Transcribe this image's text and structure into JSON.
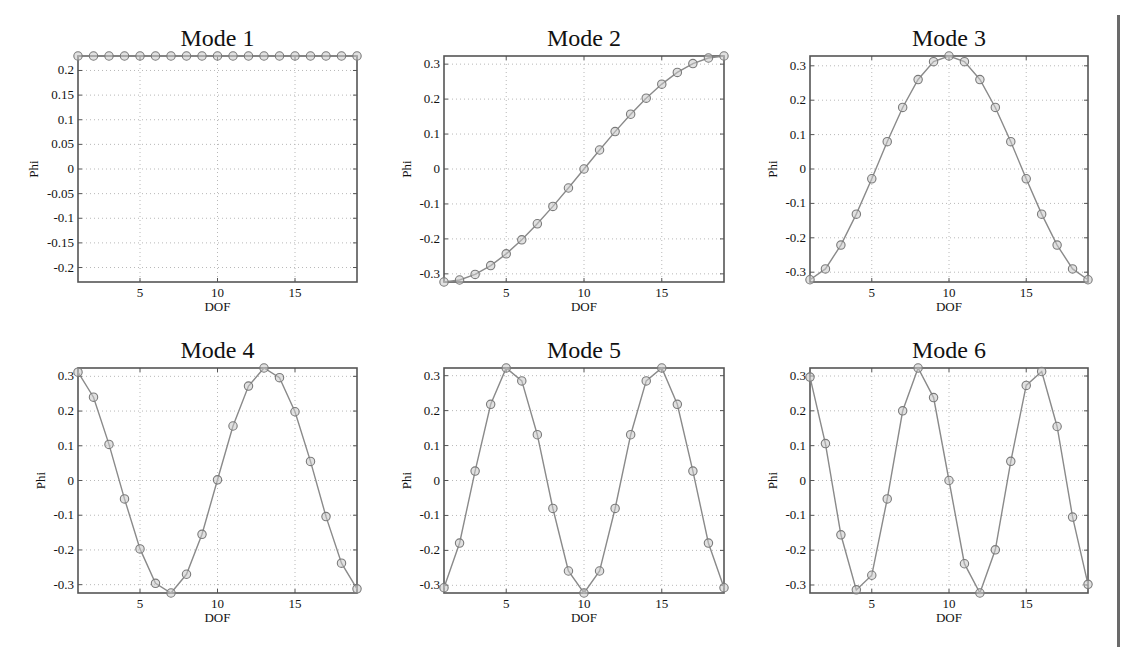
{
  "figure": {
    "layout": {
      "rows": 2,
      "cols": 3
    },
    "colors": {
      "line": "#8a8a8a",
      "marker_edge": "#7a7a7a",
      "marker_fill": "#c8c8c8",
      "axes": "#555555",
      "grid": "#b8b8b8"
    }
  },
  "chart_data": [
    {
      "type": "line",
      "title": "Mode 1",
      "xlabel": "DOF",
      "ylabel": "Phi",
      "x": [
        1,
        2,
        3,
        4,
        5,
        6,
        7,
        8,
        9,
        10,
        11,
        12,
        13,
        14,
        15,
        16,
        17,
        18,
        19
      ],
      "values": [
        0.2294,
        0.2294,
        0.2294,
        0.2294,
        0.2294,
        0.2294,
        0.2294,
        0.2294,
        0.2294,
        0.2294,
        0.2294,
        0.2294,
        0.2294,
        0.2294,
        0.2294,
        0.2294,
        0.2294,
        0.2294,
        0.2294
      ],
      "xlim": [
        1,
        19
      ],
      "ylim": [
        -0.2294,
        0.2294
      ],
      "xticks": [
        5,
        10,
        15
      ],
      "yticks": [
        0.2,
        0.15,
        0.1,
        0.05,
        0,
        -0.05,
        -0.1,
        -0.15,
        -0.2
      ],
      "ytick_labels": [
        "0.2",
        "0.15",
        "0.1",
        "0.05",
        "0",
        "-0.05",
        "-0.1",
        "-0.15",
        "-0.2"
      ],
      "grid": true,
      "marker": "circle"
    },
    {
      "type": "line",
      "title": "Mode 2",
      "xlabel": "DOF",
      "ylabel": "Phi",
      "x": [
        1,
        2,
        3,
        4,
        5,
        6,
        7,
        8,
        9,
        10,
        11,
        12,
        13,
        14,
        15,
        16,
        17,
        18,
        19
      ],
      "values": [
        -0.3233,
        -0.3176,
        -0.3016,
        -0.2763,
        -0.2428,
        -0.2025,
        -0.1567,
        -0.1071,
        -0.0544,
        0.0,
        0.0544,
        0.1071,
        0.1567,
        0.2025,
        0.2428,
        0.2763,
        0.3016,
        0.3176,
        0.3233
      ],
      "xlim": [
        1,
        19
      ],
      "ylim": [
        -0.3233,
        0.3233
      ],
      "xticks": [
        5,
        10,
        15
      ],
      "yticks": [
        0.3,
        0.2,
        0.1,
        0,
        -0.1,
        -0.2,
        -0.3
      ],
      "ytick_labels": [
        "0.3",
        "0.2",
        "0.1",
        "0",
        "-0.1",
        "-0.2",
        "-0.3"
      ],
      "grid": true,
      "marker": "circle"
    },
    {
      "type": "line",
      "title": "Mode 3",
      "xlabel": "DOF",
      "ylabel": "Phi",
      "x": [
        1,
        2,
        3,
        4,
        5,
        6,
        7,
        8,
        9,
        10,
        11,
        12,
        13,
        14,
        15,
        16,
        17,
        18,
        19
      ],
      "values": [
        -0.322,
        -0.2904,
        -0.2213,
        -0.1312,
        -0.0284,
        0.0795,
        0.1789,
        0.2601,
        0.3121,
        0.3285,
        0.3121,
        0.2601,
        0.1789,
        0.0795,
        -0.0284,
        -0.1312,
        -0.2213,
        -0.2904,
        -0.322
      ],
      "xlim": [
        1,
        19
      ],
      "ylim": [
        -0.3285,
        0.3285
      ],
      "xticks": [
        5,
        10,
        15
      ],
      "yticks": [
        0.3,
        0.2,
        0.1,
        0,
        -0.1,
        -0.2,
        -0.3
      ],
      "ytick_labels": [
        "0.3",
        "0.2",
        "0.1",
        "0",
        "-0.1",
        "-0.2",
        "-0.3"
      ],
      "grid": true,
      "marker": "circle"
    },
    {
      "type": "line",
      "title": "Mode 4",
      "xlabel": "DOF",
      "ylabel": "Phi",
      "x": [
        1,
        2,
        3,
        4,
        5,
        6,
        7,
        8,
        9,
        10,
        11,
        12,
        13,
        14,
        15,
        16,
        17,
        18,
        19
      ],
      "values": [
        0.312,
        0.24,
        0.104,
        -0.053,
        -0.197,
        -0.296,
        -0.324,
        -0.27,
        -0.155,
        0.002,
        0.157,
        0.272,
        0.324,
        0.296,
        0.198,
        0.055,
        -0.104,
        -0.238,
        -0.312
      ],
      "xlim": [
        1,
        19
      ],
      "ylim": [
        -0.324,
        0.324
      ],
      "xticks": [
        5,
        10,
        15
      ],
      "yticks": [
        0.3,
        0.2,
        0.1,
        0,
        -0.1,
        -0.2,
        -0.3
      ],
      "ytick_labels": [
        "0.3",
        "0.2",
        "0.1",
        "0",
        "-0.1",
        "-0.2",
        "-0.3"
      ],
      "grid": true,
      "marker": "circle"
    },
    {
      "type": "line",
      "title": "Mode 5",
      "xlabel": "DOF",
      "ylabel": "Phi",
      "x": [
        1,
        2,
        3,
        4,
        5,
        6,
        7,
        8,
        9,
        10,
        11,
        12,
        13,
        14,
        15,
        16,
        17,
        18,
        19
      ],
      "values": [
        -0.307,
        -0.179,
        0.027,
        0.218,
        0.322,
        0.285,
        0.131,
        -0.08,
        -0.259,
        -0.322,
        -0.259,
        -0.08,
        0.131,
        0.285,
        0.322,
        0.218,
        0.027,
        -0.179,
        -0.307
      ],
      "xlim": [
        1,
        19
      ],
      "ylim": [
        -0.322,
        0.322
      ],
      "xticks": [
        5,
        10,
        15
      ],
      "yticks": [
        0.3,
        0.2,
        0.1,
        0,
        -0.1,
        -0.2,
        -0.3
      ],
      "ytick_labels": [
        "0.3",
        "0.2",
        "0.1",
        "0",
        "-0.1",
        "-0.2",
        "-0.3"
      ],
      "grid": true,
      "marker": "circle"
    },
    {
      "type": "line",
      "title": "Mode 6",
      "xlabel": "DOF",
      "ylabel": "Phi",
      "x": [
        1,
        2,
        3,
        4,
        5,
        6,
        7,
        8,
        9,
        10,
        11,
        12,
        13,
        14,
        15,
        16,
        17,
        18,
        19
      ],
      "values": [
        0.297,
        0.106,
        -0.156,
        -0.314,
        -0.272,
        -0.053,
        0.2,
        0.323,
        0.238,
        0.0,
        -0.239,
        -0.323,
        -0.199,
        0.055,
        0.273,
        0.313,
        0.155,
        -0.105,
        -0.298
      ],
      "xlim": [
        1,
        19
      ],
      "ylim": [
        -0.323,
        0.323
      ],
      "xticks": [
        5,
        10,
        15
      ],
      "yticks": [
        0.3,
        0.2,
        0.1,
        0,
        -0.1,
        -0.2,
        -0.3
      ],
      "ytick_labels": [
        "0.3",
        "0.2",
        "0.1",
        "0",
        "-0.1",
        "-0.2",
        "-0.3"
      ],
      "grid": true,
      "marker": "circle"
    }
  ]
}
